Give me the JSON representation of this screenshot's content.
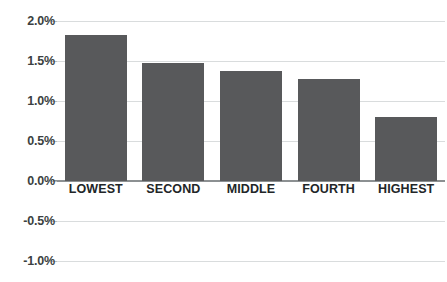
{
  "chart_data": {
    "type": "bar",
    "title": "",
    "subtitle": "",
    "xlabel": "",
    "ylabel": "",
    "categories": [
      "LOWEST",
      "SECOND",
      "MIDDLE",
      "FOURTH",
      "HIGHEST"
    ],
    "values": [
      1.83,
      1.47,
      1.37,
      1.27,
      0.8
    ],
    "value_labels": [
      "1.83%",
      "1.47%",
      "1.37%",
      "1.27%",
      "0.80%"
    ],
    "series": [
      {
        "name": "",
        "values": [
          1.83,
          1.47,
          1.37,
          1.27,
          0.8
        ]
      }
    ],
    "ylim": [
      -1.25,
      2.0
    ],
    "ytick_values": [
      2.0,
      1.5,
      1.0,
      0.5,
      0.0,
      -0.5,
      -1.0
    ],
    "ytick_labels": [
      "2.0%",
      "1.5%",
      "1.0%",
      "0.5%",
      "0.0%",
      "-0.5%",
      "-1.0%"
    ],
    "grid": true,
    "legend": false,
    "legend_position": "none",
    "bar_color": "#58595b",
    "gridline_color": "#d9dcdd",
    "axis_color": "#8c9092",
    "background_color": "#ffffff",
    "annotations": []
  }
}
